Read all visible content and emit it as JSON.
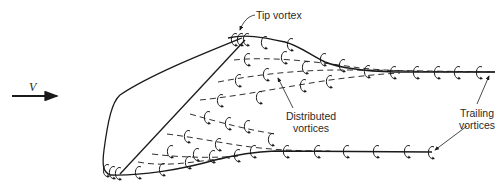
{
  "diagram": {
    "type": "wing-vortex-system",
    "freestream": {
      "symbol": "V",
      "direction": "right"
    },
    "labels": {
      "tip_vortex": "Tip vortex",
      "distributed_line1": "Distributed",
      "distributed_line2": "vortices",
      "trailing_line1": "Trailing",
      "trailing_line2": "vortices",
      "velocity": "V"
    },
    "colors": {
      "line": "#1a1a1a",
      "text": "#2a2a2a",
      "background": "#ffffff"
    }
  }
}
